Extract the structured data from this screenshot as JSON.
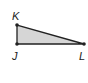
{
  "figure": {
    "type": "right-triangle",
    "fill_color": "#d6d6d6",
    "stroke_color": "#222222",
    "vertices": [
      {
        "name": "K",
        "label": "K"
      },
      {
        "name": "J",
        "label": "J"
      },
      {
        "name": "L",
        "label": "L"
      }
    ]
  }
}
